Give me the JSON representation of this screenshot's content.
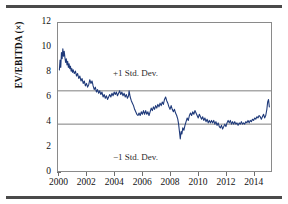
{
  "figure": {
    "top_rule": "divider",
    "bottom_rule": "divider"
  },
  "chart_data": {
    "type": "line",
    "title": "",
    "subtitle": "",
    "xlabel": "",
    "ylabel": "EV/EBITDA (×)",
    "xlim": [
      1999.9,
      2015.3
    ],
    "ylim": [
      0,
      12
    ],
    "grid": false,
    "legend": null,
    "y_ticks": [
      0,
      2,
      4,
      6,
      8,
      10,
      12
    ],
    "y_tick_labels": [
      "0",
      "2",
      "4",
      "6",
      "8",
      "10",
      "12"
    ],
    "x_ticks": [
      2000,
      2002,
      2004,
      2006,
      2008,
      2010,
      2012,
      2014
    ],
    "x_tick_labels": [
      "2000",
      "2002",
      "2004",
      "2006",
      "2008",
      "2010",
      "2012",
      "2014"
    ],
    "series": [
      {
        "name": "EV/EBITDA",
        "color": "#1f3a7a",
        "x": [
          2000.0,
          2000.05,
          2000.1,
          2000.15,
          2000.2,
          2000.25,
          2000.3,
          2000.35,
          2000.4,
          2000.45,
          2000.5,
          2000.55,
          2000.6,
          2000.65,
          2000.7,
          2000.75,
          2000.8,
          2000.85,
          2000.9,
          2000.95,
          2001.0,
          2001.08,
          2001.16,
          2001.24,
          2001.32,
          2001.4,
          2001.48,
          2001.56,
          2001.64,
          2001.72,
          2001.8,
          2001.88,
          2001.96,
          2002.04,
          2002.12,
          2002.2,
          2002.28,
          2002.36,
          2002.44,
          2002.52,
          2002.6,
          2002.68,
          2002.76,
          2002.84,
          2002.92,
          2003.0,
          2003.08,
          2003.16,
          2003.24,
          2003.32,
          2003.4,
          2003.48,
          2003.56,
          2003.64,
          2003.72,
          2003.8,
          2003.88,
          2003.96,
          2004.04,
          2004.12,
          2004.2,
          2004.28,
          2004.36,
          2004.44,
          2004.52,
          2004.6,
          2004.68,
          2004.76,
          2004.84,
          2004.92,
          2005.0,
          2005.04,
          2005.12,
          2005.2,
          2005.28,
          2005.36,
          2005.44,
          2005.52,
          2005.6,
          2005.68,
          2005.76,
          2005.84,
          2005.92,
          2006.0,
          2006.08,
          2006.16,
          2006.24,
          2006.32,
          2006.4,
          2006.48,
          2006.56,
          2006.64,
          2006.72,
          2006.8,
          2006.88,
          2006.96,
          2007.04,
          2007.12,
          2007.2,
          2007.28,
          2007.36,
          2007.44,
          2007.52,
          2007.6,
          2007.68,
          2007.76,
          2007.84,
          2007.92,
          2008.0,
          2008.08,
          2008.16,
          2008.24,
          2008.32,
          2008.4,
          2008.48,
          2008.56,
          2008.62,
          2008.68,
          2008.74,
          2008.8,
          2008.86,
          2008.92,
          2009.0,
          2009.08,
          2009.16,
          2009.24,
          2009.32,
          2009.4,
          2009.48,
          2009.56,
          2009.64,
          2009.72,
          2009.8,
          2009.88,
          2009.96,
          2010.04,
          2010.12,
          2010.2,
          2010.28,
          2010.36,
          2010.44,
          2010.52,
          2010.6,
          2010.68,
          2010.76,
          2010.84,
          2010.92,
          2011.0,
          2011.08,
          2011.16,
          2011.24,
          2011.32,
          2011.4,
          2011.48,
          2011.56,
          2011.64,
          2011.72,
          2011.8,
          2011.88,
          2011.96,
          2012.04,
          2012.12,
          2012.2,
          2012.28,
          2012.36,
          2012.44,
          2012.52,
          2012.6,
          2012.68,
          2012.76,
          2012.84,
          2012.92,
          2013.0,
          2013.08,
          2013.16,
          2013.24,
          2013.32,
          2013.4,
          2013.48,
          2013.56,
          2013.64,
          2013.72,
          2013.8,
          2013.88,
          2013.96,
          2014.04,
          2014.12,
          2014.2,
          2014.28,
          2014.36,
          2014.44,
          2014.52,
          2014.6,
          2014.68,
          2014.76,
          2014.84,
          2014.92,
          2015.0,
          2015.06,
          2015.12,
          2015.18
        ],
        "y": [
          8.2,
          9.0,
          8.4,
          9.6,
          9.1,
          9.9,
          9.3,
          9.7,
          9.2,
          8.8,
          9.1,
          8.6,
          8.9,
          8.4,
          8.7,
          8.3,
          8.5,
          8.1,
          8.3,
          8.0,
          8.2,
          7.9,
          8.1,
          7.7,
          7.9,
          7.5,
          7.7,
          7.3,
          7.5,
          7.1,
          7.3,
          6.9,
          7.1,
          6.8,
          7.0,
          7.4,
          7.1,
          7.3,
          6.9,
          6.6,
          6.8,
          6.4,
          6.6,
          6.3,
          6.5,
          6.2,
          6.4,
          6.0,
          6.2,
          5.9,
          6.1,
          5.8,
          6.0,
          6.2,
          6.0,
          6.3,
          6.1,
          6.4,
          6.2,
          6.4,
          6.1,
          6.3,
          6.5,
          6.2,
          6.4,
          6.1,
          6.3,
          6.0,
          6.2,
          5.9,
          6.1,
          6.5,
          6.0,
          5.7,
          5.5,
          5.3,
          5.0,
          4.8,
          4.6,
          4.5,
          4.7,
          4.5,
          4.8,
          4.6,
          4.9,
          4.6,
          4.9,
          4.6,
          4.8,
          4.5,
          4.8,
          5.1,
          4.9,
          5.2,
          5.0,
          5.3,
          5.1,
          5.4,
          5.2,
          5.5,
          5.3,
          5.6,
          5.4,
          5.8,
          6.0,
          5.7,
          5.5,
          5.2,
          5.0,
          5.3,
          5.0,
          4.8,
          5.0,
          4.7,
          4.5,
          4.2,
          3.8,
          3.2,
          2.6,
          3.2,
          3.0,
          3.5,
          3.3,
          3.7,
          4.0,
          4.3,
          4.1,
          4.5,
          4.7,
          4.5,
          4.8,
          4.6,
          4.9,
          4.7,
          4.5,
          4.3,
          4.6,
          4.4,
          4.2,
          4.4,
          4.1,
          4.3,
          4.0,
          4.2,
          3.9,
          4.1,
          3.9,
          4.1,
          3.9,
          4.1,
          3.8,
          4.0,
          3.7,
          3.9,
          3.6,
          3.5,
          3.7,
          3.4,
          3.6,
          3.8,
          3.6,
          3.9,
          4.1,
          3.9,
          4.1,
          3.8,
          4.0,
          3.8,
          4.0,
          3.8,
          3.9,
          3.7,
          3.9,
          3.8,
          4.0,
          3.8,
          3.9,
          3.8,
          4.0,
          3.9,
          4.1,
          3.9,
          4.1,
          4.0,
          4.2,
          4.1,
          4.3,
          4.2,
          4.4,
          4.3,
          4.5,
          4.4,
          4.2,
          4.4,
          4.6,
          4.3,
          4.5,
          5.0,
          5.6,
          5.8,
          5.2
        ]
      }
    ],
    "reference_lines": [
      {
        "label": "+1 Std. Dev.",
        "value": 6.5,
        "color": "#6f6f6f",
        "orientation": "horizontal"
      },
      {
        "label": "−1 Std. Dev.",
        "value": 3.8,
        "color": "#6f6f6f",
        "orientation": "horizontal"
      }
    ],
    "annotations": [
      {
        "text": "+1 Std. Dev.",
        "x": 2005.6,
        "y": 7.9
      },
      {
        "text": "−1 Std. Dev.",
        "x": 2005.6,
        "y": 2.9
      }
    ]
  }
}
